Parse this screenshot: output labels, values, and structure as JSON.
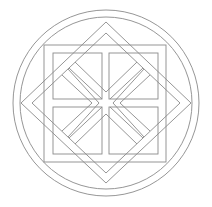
{
  "figure": {
    "stroke_color": "#8a8a8a",
    "background": "#ffffff",
    "center": [
      106,
      103
    ],
    "circles": {
      "outer_r": 93,
      "inner_r": 86
    },
    "square": {
      "x": 44,
      "y": 45,
      "w": 122,
      "h": 117
    },
    "inner_squares": [
      {
        "x": 53,
        "y": 53,
        "w": 49,
        "h": 46
      },
      {
        "x": 109,
        "y": 53,
        "w": 49,
        "h": 46
      },
      {
        "x": 53,
        "y": 107,
        "w": 49,
        "h": 47
      },
      {
        "x": 109,
        "y": 107,
        "w": 49,
        "h": 47
      }
    ],
    "diamonds": {
      "outer": [
        [
          106,
          22
        ],
        [
          191,
          103
        ],
        [
          106,
          183
        ],
        [
          21,
          103
        ]
      ],
      "inner": [
        [
          106,
          33
        ],
        [
          180,
          103
        ],
        [
          106,
          173
        ],
        [
          32,
          103
        ]
      ]
    }
  }
}
